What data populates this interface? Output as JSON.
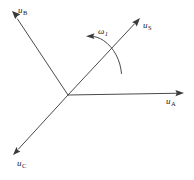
{
  "figure": {
    "type": "vector-diagram",
    "background_color": "#ffffff",
    "line_color": "#4a4a4a",
    "text_color": "#1a1a1a",
    "width": 194,
    "height": 180
  },
  "diagram_data": {
    "origin": {
      "x": 68,
      "y": 95
    },
    "axes": [
      {
        "id": "u-a",
        "symbol": "u",
        "subscript": "A",
        "label": "uA",
        "angle_deg": 0,
        "tip": {
          "x": 184,
          "y": 93
        },
        "label_pos": {
          "x": 166,
          "y": 97
        }
      },
      {
        "id": "u-b",
        "symbol": "u",
        "subscript": "B",
        "label": "uB",
        "angle_deg": 120,
        "tip": {
          "x": 12,
          "y": 11
        },
        "label_pos": {
          "x": 18,
          "y": 6
        }
      },
      {
        "id": "u-c",
        "symbol": "u",
        "subscript": "C",
        "label": "uC",
        "angle_deg": 240,
        "tip": {
          "x": 13,
          "y": 155
        },
        "label_pos": {
          "x": 17,
          "y": 159
        }
      },
      {
        "id": "u-s",
        "symbol": "u",
        "subscript": "S",
        "label": "uS",
        "angle_deg": 45,
        "tip": {
          "x": 140,
          "y": 18
        },
        "label_pos": {
          "x": 143,
          "y": 21
        }
      }
    ],
    "rotation_indicator": {
      "id": "omega-1",
      "symbol": "ω",
      "subscript": "1",
      "label": "ω1",
      "direction": "counter-clockwise",
      "arc_start": {
        "x": 121,
        "y": 73
      },
      "arc_end": {
        "x": 88,
        "y": 36
      },
      "arrow_tip": {
        "x": 88,
        "y": 36
      },
      "label_pos": {
        "x": 98,
        "y": 27
      }
    }
  }
}
